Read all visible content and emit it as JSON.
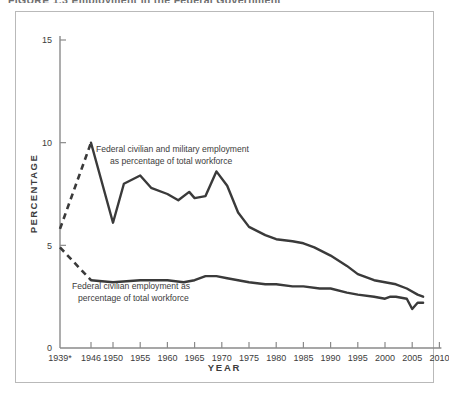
{
  "figure": {
    "title_cut": "FIGURE 1.3   Employment in the Federal Government",
    "ylabel": "PERCENTAGE",
    "xlabel": "YEAR"
  },
  "chart_data": {
    "type": "line",
    "title": "FIGURE 1.3   Employment in the Federal Government",
    "xlabel": "YEAR",
    "ylabel": "PERCENTAGE",
    "xlim": [
      1939,
      2010
    ],
    "ylim": [
      0,
      15
    ],
    "ytick_labels": [
      "0",
      "5",
      "10",
      "15"
    ],
    "yticks": [
      0,
      5,
      10,
      15
    ],
    "xtick_labels": [
      "1939*",
      "1946",
      "1950",
      "1955",
      "1960",
      "1965",
      "1970",
      "1975",
      "1980",
      "1985",
      "1990",
      "1995",
      "2000",
      "2005",
      "2010"
    ],
    "xticks": [
      1939,
      1946,
      1950,
      1955,
      1960,
      1965,
      1970,
      1975,
      1980,
      1985,
      1990,
      1995,
      2000,
      2005,
      2010
    ],
    "grid": false,
    "legend": "none",
    "line_color": "#3a3a3a",
    "series": [
      {
        "name": "Federal civilian and military employment as percentage of total workforce",
        "annotation_line1": "Federal civilian and military employment",
        "annotation_line2": "as percentage of total workforce",
        "dashed_from": 1939,
        "dashed_to": 1946,
        "x": [
          1939,
          1946,
          1950,
          1952,
          1955,
          1957,
          1960,
          1962,
          1964,
          1965,
          1967,
          1969,
          1971,
          1973,
          1975,
          1978,
          1980,
          1983,
          1985,
          1987,
          1990,
          1993,
          1995,
          1998,
          2000,
          2002,
          2004,
          2006,
          2007
        ],
        "values": [
          5.8,
          10.0,
          6.1,
          8.0,
          8.4,
          7.8,
          7.5,
          7.2,
          7.6,
          7.3,
          7.4,
          8.6,
          7.9,
          6.6,
          5.9,
          5.5,
          5.3,
          5.2,
          5.1,
          4.9,
          4.5,
          4.0,
          3.6,
          3.3,
          3.2,
          3.1,
          2.9,
          2.6,
          2.5
        ]
      },
      {
        "name": "Federal civilian employment as percentage of total workforce",
        "annotation_line1": "Federal civilian employment as",
        "annotation_line2": "percentage of total workforce",
        "dashed_from": 1939,
        "dashed_to": 1946,
        "x": [
          1939,
          1946,
          1950,
          1955,
          1960,
          1963,
          1965,
          1967,
          1969,
          1971,
          1975,
          1978,
          1980,
          1983,
          1985,
          1988,
          1990,
          1993,
          1995,
          1998,
          2000,
          2001,
          2002,
          2004,
          2005,
          2006,
          2007
        ],
        "values": [
          4.9,
          3.3,
          3.2,
          3.3,
          3.3,
          3.2,
          3.3,
          3.5,
          3.5,
          3.4,
          3.2,
          3.1,
          3.1,
          3.0,
          3.0,
          2.9,
          2.9,
          2.7,
          2.6,
          2.5,
          2.4,
          2.5,
          2.5,
          2.4,
          1.9,
          2.2,
          2.2
        ]
      }
    ]
  }
}
